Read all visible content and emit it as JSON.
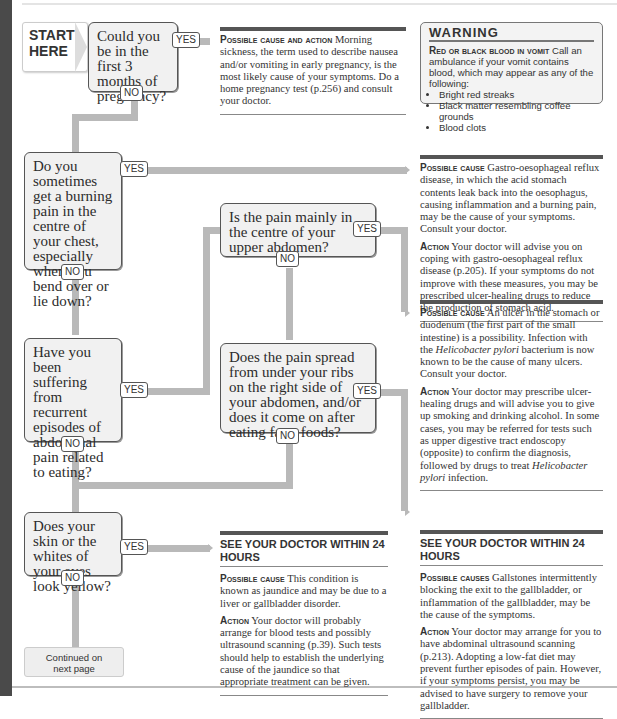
{
  "start_label": {
    "line1": "START",
    "line2": "HERE"
  },
  "tags": {
    "yes": "YES",
    "no": "NO"
  },
  "questions": [
    {
      "id": "q1",
      "text": "Could you be in the first 3 months of pregnancy?"
    },
    {
      "id": "q2",
      "text": "Do you sometimes get a burning pain in the centre of your chest, especially when you bend over or lie down?"
    },
    {
      "id": "q3",
      "text": "Is the pain mainly in the centre of your upper abdomen?"
    },
    {
      "id": "q4",
      "text": "Have you been suffering from recurrent episodes of abdominal pain related to eating?"
    },
    {
      "id": "q5",
      "text": "Does the pain spread from under your ribs on the right side of your abdomen, and/or does it come on after eating fatty foods?"
    },
    {
      "id": "q6",
      "text": "Does your skin or the whites of your eyes look yellow?"
    }
  ],
  "outcomes": {
    "pregnancy": {
      "label": "Possible cause and action",
      "text": "Morning sickness, the term used to describe nausea and/or vomiting in early pregnancy, is the most likely cause of your symptoms. Do a home pregnancy test (p.256) and consult your doctor."
    },
    "reflux": {
      "cause_label": "Possible cause",
      "cause_text": "Gastro-oesophageal reflux disease, in which the acid stomach contents leak back into the oesophagus, causing inflammation and a burning pain, may be the cause of your symptoms. Consult your doctor.",
      "action_label": "Action",
      "action_text": "Your doctor will advise you on coping with gastro-oesophageal reflux disease (p.205). If your symptoms do not improve with these measures, you may be prescribed ulcer-healing drugs to reduce the production of stomach acid."
    },
    "ulcer": {
      "cause_label": "Possible cause",
      "cause_text_1": "An ulcer in the stomach or duodenum (the first part of the small intestine) is a possibility. Infection with the",
      "cause_italic_1": "Helicobacter pylori",
      "cause_text_2": "bacterium is now known to be the cause of many ulcers. Consult your doctor.",
      "action_label": "Action",
      "action_text_1": "Your doctor may prescribe ulcer-healing drugs and will advise you to give up smoking and drinking alcohol. In some cases, you may be referred for tests such as upper digestive tract endoscopy (opposite) to confirm the diagnosis, followed by drugs to treat",
      "action_italic": "Helicobacter pylori",
      "action_text_2": "infection."
    },
    "jaundice": {
      "heading": "SEE YOUR DOCTOR WITHIN 24 HOURS",
      "cause_label": "Possible cause",
      "cause_text": "This condition is known as jaundice and may be due to a liver or gallbladder disorder.",
      "action_label": "Action",
      "action_text": "Your doctor will probably arrange for blood tests and possibly ultrasound scanning (p.39). Such tests should help to establish the underlying cause of the jaundice so that appropriate treatment can be given."
    },
    "gallstones": {
      "heading": "SEE YOUR DOCTOR WITHIN 24 HOURS",
      "cause_label": "Possible causes",
      "cause_text": "Gallstones intermittently blocking the exit to the gallbladder, or inflammation of the gallbladder, may be the cause of the symptoms.",
      "action_label": "Action",
      "action_text": "Your doctor may arrange for you to have abdominal ultrasound scanning (p.213). Adopting a low-fat diet may prevent further episodes of pain. However, if your symptoms persist, you may be advised to have surgery to remove your gallbladder."
    }
  },
  "warning": {
    "title": "WARNING",
    "label": "Red or black blood in vomit",
    "text": "Call an ambulance if your vomit contains blood, which may appear as any of the following:",
    "items": [
      "Bright red streaks",
      "Black matter resembling coffee grounds",
      "Blood clots"
    ]
  },
  "continued": {
    "line1": "Continued on",
    "line2": "next page"
  }
}
